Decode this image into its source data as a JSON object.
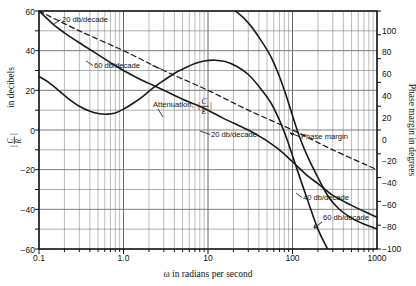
{
  "figure": {
    "name": "bode-plot-attenuation-phase-margin"
  },
  "axes": {
    "x": {
      "label": "ω in radians per second",
      "ticks": [
        "0.1",
        "1.0",
        "10",
        "100",
        "1000"
      ],
      "min": 0.1,
      "max": 1000,
      "scale": "log"
    },
    "y_left": {
      "label_prefix": "",
      "label_suffix": "in decibels",
      "numerator": "C",
      "denominator": "R",
      "ticks": [
        "60",
        "40",
        "20",
        "0",
        "−20",
        "−40",
        "−60"
      ],
      "min": -60,
      "max": 60
    },
    "y_right": {
      "label": "Phase margin in degrees",
      "ticks": [
        "100",
        "80",
        "60",
        "40",
        "20",
        "0",
        "−20",
        "−40",
        "−60",
        "−80",
        "−100"
      ],
      "min": -100,
      "max": 100
    }
  },
  "annotations": {
    "slope_20_top": "20 db/decade",
    "slope_60_top": "60 db/decade",
    "slope_20_mid": "20 db/decade",
    "slope_40_low": "40 db/decade",
    "slope_60_low": "60 db/decade",
    "attenuation_label": "Attenuation,",
    "attenuation_numerator": "C",
    "attenuation_denominator": "E",
    "phase_margin_label": "Phase margin"
  },
  "colors": {
    "grid": "#8a8a8a",
    "frame": "#1a1a1a",
    "curve": "#1a1a1a",
    "background": "#ffffff"
  },
  "chart_data": {
    "type": "line",
    "title": "",
    "xlabel": "ω in radians per second",
    "ylabel": "|C/R| in decibels",
    "ylabel_secondary": "Phase margin in degrees",
    "xscale": "log",
    "xlim": [
      0.1,
      1000
    ],
    "ylim": [
      -60,
      60
    ],
    "ylim_secondary": [
      -100,
      100
    ],
    "grid": true,
    "legend": "none",
    "series": [
      {
        "name": "closed-loop-response-C-over-R",
        "axis": "left",
        "style": "solid",
        "points": [
          [
            0.1,
            27
          ],
          [
            0.13,
            24
          ],
          [
            0.17,
            20
          ],
          [
            0.22,
            16
          ],
          [
            0.3,
            12
          ],
          [
            0.4,
            9.5
          ],
          [
            0.52,
            8.2
          ],
          [
            0.65,
            8.0
          ],
          [
            0.8,
            8.6
          ],
          [
            1.0,
            10.5
          ],
          [
            1.3,
            13.5
          ],
          [
            1.7,
            17
          ],
          [
            2.2,
            21
          ],
          [
            3.0,
            25
          ],
          [
            4.0,
            28.5
          ],
          [
            5.5,
            31.5
          ],
          [
            7.0,
            33.5
          ],
          [
            9.0,
            34.8
          ],
          [
            12,
            35.2
          ],
          [
            16,
            34.5
          ],
          [
            22,
            32
          ],
          [
            30,
            28
          ],
          [
            40,
            22
          ],
          [
            55,
            14
          ],
          [
            70,
            5
          ],
          [
            85,
            -4
          ],
          [
            100,
            -13
          ],
          [
            120,
            -23
          ],
          [
            150,
            -35
          ],
          [
            200,
            -50
          ],
          [
            260,
            -60
          ]
        ]
      },
      {
        "name": "attenuation-C-over-E",
        "axis": "left",
        "style": "solid",
        "points": [
          [
            0.1,
            60
          ],
          [
            0.15,
            53
          ],
          [
            0.2,
            49
          ],
          [
            0.3,
            44
          ],
          [
            0.5,
            38
          ],
          [
            0.7,
            34
          ],
          [
            1.0,
            30
          ],
          [
            1.5,
            26
          ],
          [
            2.0,
            23.5
          ],
          [
            3.0,
            20
          ],
          [
            5.0,
            15.5
          ],
          [
            7.0,
            13
          ],
          [
            10,
            10
          ],
          [
            15,
            6
          ],
          [
            20,
            3.5
          ],
          [
            30,
            0
          ],
          [
            40,
            -3
          ],
          [
            50,
            -5.5
          ],
          [
            70,
            -10
          ],
          [
            100,
            -16
          ],
          [
            150,
            -23
          ],
          [
            200,
            -27
          ],
          [
            300,
            -33
          ],
          [
            500,
            -38
          ],
          [
            700,
            -41
          ],
          [
            1000,
            -44
          ]
        ]
      },
      {
        "name": "asymptote-20-db-per-decade",
        "axis": "left",
        "style": "dashed",
        "points": [
          [
            0.1,
            60
          ],
          [
            0.3,
            50
          ],
          [
            1.0,
            40
          ],
          [
            3.0,
            30
          ],
          [
            10,
            20
          ],
          [
            30,
            10
          ],
          [
            100,
            0
          ],
          [
            300,
            -10
          ],
          [
            1000,
            -20
          ]
        ]
      },
      {
        "name": "phase-margin",
        "axis": "right",
        "style": "solid",
        "points": [
          [
            9,
            110
          ],
          [
            12,
            108
          ],
          [
            16,
            105
          ],
          [
            22,
            99
          ],
          [
            30,
            90
          ],
          [
            40,
            78
          ],
          [
            55,
            62
          ],
          [
            70,
            45
          ],
          [
            85,
            28
          ],
          [
            100,
            12
          ],
          [
            120,
            -5
          ],
          [
            150,
            -22
          ],
          [
            200,
            -40
          ],
          [
            260,
            -55
          ],
          [
            350,
            -66
          ],
          [
            500,
            -74
          ],
          [
            700,
            -79
          ],
          [
            1000,
            -83
          ]
        ]
      }
    ]
  }
}
